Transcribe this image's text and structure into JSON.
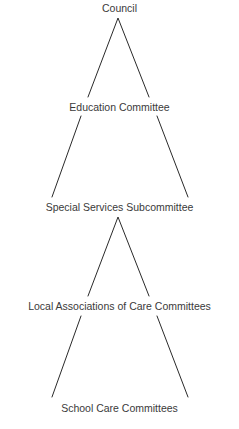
{
  "diagram": {
    "type": "hierarchy",
    "line_color": "#2a2a2a",
    "nodes": [
      {
        "id": "council",
        "label": "Council"
      },
      {
        "id": "education",
        "label": "Education Committee"
      },
      {
        "id": "special-services",
        "label": "Special Services Subcommittee"
      },
      {
        "id": "local-associations",
        "label": "Local Associations of Care Committees"
      },
      {
        "id": "school-care",
        "label": "School Care Committees"
      }
    ],
    "edges": [
      {
        "from": "council",
        "to": "education"
      },
      {
        "from": "education",
        "to": "special-services"
      },
      {
        "from": "special-services",
        "to": "local-associations"
      },
      {
        "from": "local-associations",
        "to": "school-care"
      }
    ]
  }
}
